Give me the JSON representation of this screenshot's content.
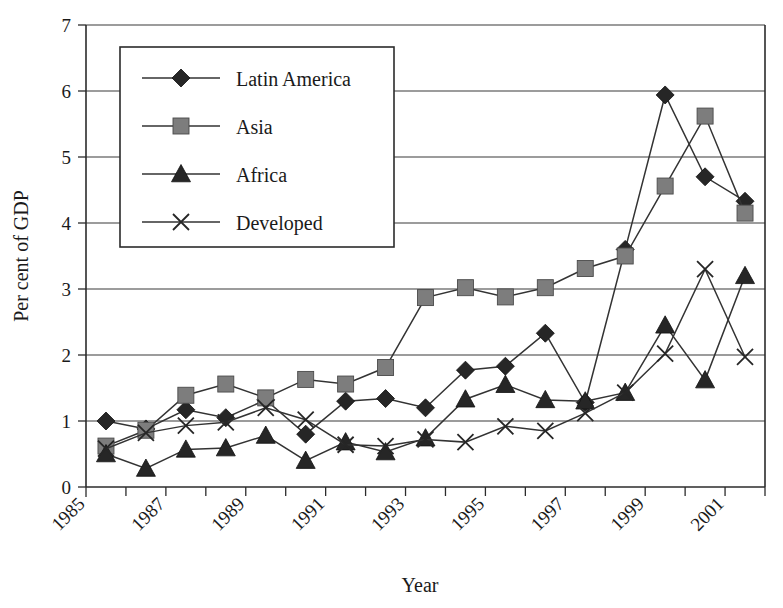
{
  "chart_data": {
    "type": "line",
    "title": "",
    "xlabel": "Year",
    "ylabel": "Per cent of GDP",
    "xlim": [
      1985,
      2002
    ],
    "ylim": [
      0,
      7
    ],
    "ytick_labels": [
      "0",
      "1",
      "2",
      "3",
      "4",
      "5",
      "6",
      "7"
    ],
    "ytick_values": [
      0,
      1,
      2,
      3,
      4,
      5,
      6,
      7
    ],
    "xtick_labels": [
      "1985",
      "1987",
      "1989",
      "1991",
      "1993",
      "1995",
      "1997",
      "1999",
      "2001"
    ],
    "xtick_values": [
      1985,
      1987,
      1989,
      1991,
      1993,
      1995,
      1997,
      1999,
      2001
    ],
    "minor_xticks": [
      1986,
      1988,
      1990,
      1992,
      1994,
      1996,
      1998,
      2000,
      2002
    ],
    "grid": "horizontal",
    "legend_position": "upper-left-inside",
    "x": [
      1985.5,
      1986.5,
      1987.5,
      1988.5,
      1989.5,
      1990.5,
      1991.5,
      1992.5,
      1993.5,
      1994.5,
      1995.5,
      1996.5,
      1997.5,
      1998.5,
      1999.5,
      2000.5,
      2001.5
    ],
    "series": [
      {
        "name": "Latin America",
        "marker": "diamond",
        "values": [
          1.0,
          0.88,
          1.17,
          1.05,
          1.32,
          0.8,
          1.3,
          1.34,
          1.2,
          1.77,
          1.83,
          2.33,
          1.28,
          3.6,
          5.94,
          4.7,
          4.33
        ]
      },
      {
        "name": "Asia",
        "marker": "square",
        "values": [
          0.62,
          0.86,
          1.39,
          1.56,
          1.35,
          1.63,
          1.56,
          1.81,
          2.87,
          3.02,
          2.88,
          3.02,
          3.31,
          3.5,
          4.56,
          5.62,
          4.15
        ]
      },
      {
        "name": "Africa",
        "marker": "triangle",
        "values": [
          0.5,
          0.28,
          0.57,
          0.59,
          0.78,
          0.4,
          0.68,
          0.53,
          0.74,
          1.33,
          1.55,
          1.32,
          1.3,
          1.43,
          2.45,
          1.62,
          3.2
        ]
      },
      {
        "name": "Developed",
        "marker": "cross",
        "values": [
          0.58,
          0.82,
          0.93,
          0.98,
          1.2,
          1.02,
          0.64,
          0.62,
          0.72,
          0.68,
          0.92,
          0.85,
          1.12,
          1.43,
          2.02,
          3.3,
          1.97
        ]
      }
    ]
  },
  "legend": {
    "items": [
      {
        "label": "Latin America",
        "marker": "diamond-marker"
      },
      {
        "label": "Asia",
        "marker": "square-marker"
      },
      {
        "label": "Africa",
        "marker": "triangle-marker"
      },
      {
        "label": "Developed",
        "marker": "cross-marker"
      }
    ]
  },
  "colors": {
    "background": "#ffffff",
    "axis": "#2b2b2b",
    "grid": "#3a3a3a",
    "line": "#333333",
    "marker_dark": "#262626",
    "marker_grey": "#7d7d7d"
  }
}
